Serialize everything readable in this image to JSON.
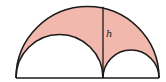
{
  "diagram": {
    "type": "arbelos",
    "label_h": "h",
    "colors": {
      "shaded": "#f2b8ad",
      "stroke": "#1a1a1a",
      "background": "#ffffff"
    }
  }
}
